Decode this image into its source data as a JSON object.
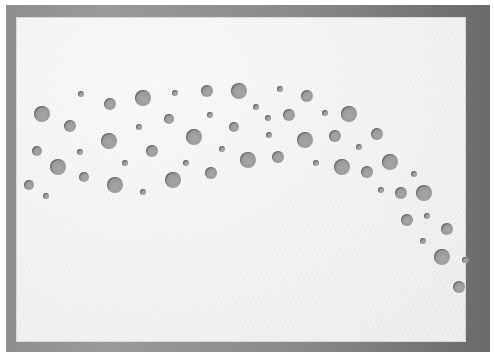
{
  "image": {
    "description": "White textured card with a curved arc of punched circular holes on a gray background",
    "colors": {
      "background": "#8e8e8e",
      "card": "#f2f2f2",
      "hole": "#9a9a9a"
    },
    "card": {
      "x": 17,
      "y": 18,
      "width": 448,
      "height": 323
    },
    "holes": [
      {
        "cx": 42,
        "cy": 114,
        "r": 8
      },
      {
        "cx": 81,
        "cy": 94,
        "r": 3
      },
      {
        "cx": 110,
        "cy": 104,
        "r": 6
      },
      {
        "cx": 143,
        "cy": 98,
        "r": 8
      },
      {
        "cx": 175,
        "cy": 93,
        "r": 3
      },
      {
        "cx": 207,
        "cy": 91,
        "r": 6
      },
      {
        "cx": 239,
        "cy": 91,
        "r": 8
      },
      {
        "cx": 70,
        "cy": 126,
        "r": 6
      },
      {
        "cx": 139,
        "cy": 127,
        "r": 3
      },
      {
        "cx": 169,
        "cy": 119,
        "r": 5
      },
      {
        "cx": 210,
        "cy": 115,
        "r": 3
      },
      {
        "cx": 234,
        "cy": 127,
        "r": 5
      },
      {
        "cx": 256,
        "cy": 107,
        "r": 3
      },
      {
        "cx": 280,
        "cy": 89,
        "r": 3
      },
      {
        "cx": 307,
        "cy": 96,
        "r": 6
      },
      {
        "cx": 37,
        "cy": 151,
        "r": 5
      },
      {
        "cx": 80,
        "cy": 152,
        "r": 3
      },
      {
        "cx": 109,
        "cy": 141,
        "r": 8
      },
      {
        "cx": 152,
        "cy": 151,
        "r": 6
      },
      {
        "cx": 194,
        "cy": 137,
        "r": 8
      },
      {
        "cx": 222,
        "cy": 149,
        "r": 3
      },
      {
        "cx": 268,
        "cy": 118,
        "r": 3
      },
      {
        "cx": 289,
        "cy": 115,
        "r": 6
      },
      {
        "cx": 325,
        "cy": 113,
        "r": 3
      },
      {
        "cx": 349,
        "cy": 114,
        "r": 8
      },
      {
        "cx": 58,
        "cy": 167,
        "r": 8
      },
      {
        "cx": 84,
        "cy": 177,
        "r": 5
      },
      {
        "cx": 125,
        "cy": 163,
        "r": 3
      },
      {
        "cx": 186,
        "cy": 163,
        "r": 3
      },
      {
        "cx": 211,
        "cy": 173,
        "r": 6
      },
      {
        "cx": 248,
        "cy": 160,
        "r": 8
      },
      {
        "cx": 269,
        "cy": 135,
        "r": 3
      },
      {
        "cx": 305,
        "cy": 140,
        "r": 8
      },
      {
        "cx": 335,
        "cy": 136,
        "r": 6
      },
      {
        "cx": 359,
        "cy": 147,
        "r": 3
      },
      {
        "cx": 377,
        "cy": 134,
        "r": 6
      },
      {
        "cx": 29,
        "cy": 185,
        "r": 5
      },
      {
        "cx": 46,
        "cy": 196,
        "r": 3
      },
      {
        "cx": 115,
        "cy": 185,
        "r": 8
      },
      {
        "cx": 143,
        "cy": 192,
        "r": 3
      },
      {
        "cx": 173,
        "cy": 180,
        "r": 8
      },
      {
        "cx": 278,
        "cy": 157,
        "r": 6
      },
      {
        "cx": 316,
        "cy": 163,
        "r": 3
      },
      {
        "cx": 342,
        "cy": 167,
        "r": 8
      },
      {
        "cx": 367,
        "cy": 172,
        "r": 6
      },
      {
        "cx": 390,
        "cy": 162,
        "r": 8
      },
      {
        "cx": 414,
        "cy": 174,
        "r": 3
      },
      {
        "cx": 381,
        "cy": 190,
        "r": 3
      },
      {
        "cx": 401,
        "cy": 193,
        "r": 6
      },
      {
        "cx": 424,
        "cy": 193,
        "r": 8
      },
      {
        "cx": 407,
        "cy": 220,
        "r": 6
      },
      {
        "cx": 427,
        "cy": 216,
        "r": 3
      },
      {
        "cx": 447,
        "cy": 229,
        "r": 6
      },
      {
        "cx": 423,
        "cy": 241,
        "r": 3
      },
      {
        "cx": 442,
        "cy": 257,
        "r": 8
      },
      {
        "cx": 465,
        "cy": 260,
        "r": 3
      },
      {
        "cx": 459,
        "cy": 287,
        "r": 6
      }
    ]
  }
}
